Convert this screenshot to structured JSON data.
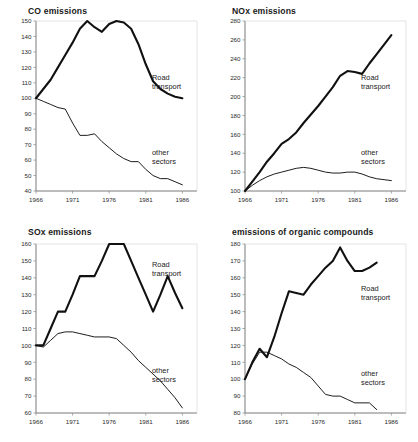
{
  "figure": {
    "background": "#ffffff",
    "ink_color": "#111111",
    "axis_color": "#6b6b6b"
  },
  "labels": {
    "road_transport": "Road\ntransport",
    "road_transport_line1": "Road",
    "road_transport_line2": "transport",
    "other_sectors_line1": "other",
    "other_sectors_line2": "sectors"
  },
  "chart_data": [
    {
      "id": "co",
      "type": "line",
      "title": "CO emissions",
      "xlabel": "",
      "ylabel": "",
      "xlim": [
        1966,
        1988
      ],
      "ylim": [
        40,
        150
      ],
      "ytick_step": 10,
      "yticks": [
        40,
        50,
        60,
        70,
        80,
        90,
        100,
        110,
        120,
        130,
        140,
        150
      ],
      "xticks": [
        1966,
        1971,
        1976,
        1981,
        1986
      ],
      "xticklabels": [
        "1966",
        "1971",
        "1976",
        "1981",
        "1986"
      ],
      "grid": false,
      "legend": "inline-annotations",
      "series": [
        {
          "name": "Road transport",
          "x": [
            1966,
            1967,
            1968,
            1969,
            1970,
            1971,
            1972,
            1973,
            1974,
            1975,
            1976,
            1977,
            1978,
            1979,
            1980,
            1981,
            1982,
            1983,
            1984,
            1985,
            1986
          ],
          "values": [
            100,
            106,
            112,
            120,
            128,
            136,
            145,
            150,
            146,
            143,
            148,
            150,
            149,
            145,
            135,
            122,
            111,
            106,
            103,
            101,
            100
          ]
        },
        {
          "name": "other sectors",
          "x": [
            1966,
            1967,
            1968,
            1969,
            1970,
            1971,
            1972,
            1973,
            1974,
            1975,
            1976,
            1977,
            1978,
            1979,
            1980,
            1981,
            1982,
            1983,
            1984,
            1985,
            1986
          ],
          "values": [
            100,
            98,
            96,
            94,
            93,
            84,
            76,
            76,
            77,
            72,
            68,
            64,
            61,
            59,
            59,
            54,
            50,
            48,
            48,
            46,
            44
          ]
        }
      ]
    },
    {
      "id": "nox",
      "type": "line",
      "title": "NOx emissions",
      "xlabel": "",
      "ylabel": "",
      "xlim": [
        1966,
        1988
      ],
      "ylim": [
        100,
        280
      ],
      "ytick_step": 20,
      "yticks": [
        100,
        120,
        140,
        160,
        180,
        200,
        220,
        240,
        260,
        280
      ],
      "xticks": [
        1966,
        1971,
        1976,
        1981,
        1986
      ],
      "xticklabels": [
        "1966",
        "1971",
        "1976",
        "1981",
        "1986"
      ],
      "grid": false,
      "legend": "inline-annotations",
      "series": [
        {
          "name": "Road transport",
          "x": [
            1966,
            1967,
            1968,
            1969,
            1970,
            1971,
            1972,
            1973,
            1974,
            1975,
            1976,
            1977,
            1978,
            1979,
            1980,
            1981,
            1982,
            1983,
            1984,
            1985,
            1986
          ],
          "values": [
            100,
            110,
            120,
            131,
            140,
            150,
            155,
            162,
            172,
            181,
            190,
            200,
            210,
            222,
            227,
            226,
            224,
            235,
            245,
            255,
            265
          ]
        },
        {
          "name": "other sectors",
          "x": [
            1966,
            1967,
            1968,
            1969,
            1970,
            1971,
            1972,
            1973,
            1974,
            1975,
            1976,
            1977,
            1978,
            1979,
            1980,
            1981,
            1982,
            1983,
            1984,
            1985,
            1986
          ],
          "values": [
            100,
            106,
            111,
            115,
            118,
            120,
            122,
            124,
            125,
            124,
            122,
            120,
            119,
            119,
            120,
            120,
            118,
            115,
            113,
            112,
            111
          ]
        }
      ]
    },
    {
      "id": "sox",
      "type": "line",
      "title": "SOx emissions",
      "xlabel": "",
      "ylabel": "",
      "xlim": [
        1966,
        1988
      ],
      "ylim": [
        60,
        160
      ],
      "ytick_step": 10,
      "yticks": [
        60,
        70,
        80,
        90,
        100,
        110,
        120,
        130,
        140,
        150,
        160
      ],
      "xticks": [
        1966,
        1971,
        1976,
        1981,
        1986
      ],
      "xticklabels": [
        "1966",
        "1971",
        "1976",
        "1981",
        "1986"
      ],
      "grid": false,
      "legend": "inline-annotations",
      "series": [
        {
          "name": "Road transport",
          "x": [
            1966,
            1967,
            1968,
            1969,
            1970,
            1971,
            1972,
            1973,
            1974,
            1975,
            1976,
            1977,
            1978,
            1979,
            1980,
            1981,
            1982,
            1983,
            1984,
            1985,
            1986
          ],
          "values": [
            100,
            100,
            110,
            120,
            120,
            130,
            141,
            141,
            141,
            150,
            160,
            160,
            160,
            150,
            140,
            130,
            120,
            130,
            141,
            131,
            122
          ]
        },
        {
          "name": "other sectors",
          "x": [
            1966,
            1967,
            1968,
            1969,
            1970,
            1971,
            1972,
            1973,
            1974,
            1975,
            1976,
            1977,
            1978,
            1979,
            1980,
            1981,
            1982,
            1983,
            1984,
            1985,
            1986
          ],
          "values": [
            100,
            99,
            103,
            107,
            108,
            108,
            107,
            106,
            105,
            105,
            105,
            104,
            100,
            96,
            91,
            87,
            83,
            79,
            74,
            69,
            63
          ]
        }
      ]
    },
    {
      "id": "organic",
      "type": "line",
      "title": "emissions of organic compounds",
      "xlabel": "",
      "ylabel": "",
      "xlim": [
        1966,
        1988
      ],
      "ylim": [
        80,
        180
      ],
      "ytick_step": 10,
      "yticks": [
        80,
        90,
        100,
        110,
        120,
        130,
        140,
        150,
        160,
        170,
        180
      ],
      "xticks": [
        1966,
        1971,
        1976,
        1981,
        1986
      ],
      "xticklabels": [
        "1966",
        "1971",
        "1976",
        "1981",
        "1986"
      ],
      "grid": false,
      "legend": "inline-annotations",
      "series": [
        {
          "name": "Road transport",
          "x": [
            1966,
            1967,
            1968,
            1969,
            1970,
            1971,
            1972,
            1973,
            1974,
            1975,
            1976,
            1977,
            1978,
            1979,
            1980,
            1981,
            1982,
            1983,
            1984
          ],
          "values": [
            100,
            110,
            118,
            113,
            125,
            139,
            152,
            151,
            150,
            156,
            161,
            166,
            170,
            178,
            170,
            164,
            164,
            166,
            169
          ]
        },
        {
          "name": "other sectors",
          "x": [
            1966,
            1967,
            1968,
            1969,
            1970,
            1971,
            1972,
            1973,
            1974,
            1975,
            1976,
            1977,
            1978,
            1979,
            1980,
            1981,
            1982,
            1983,
            1984
          ],
          "values": [
            100,
            109,
            116,
            116,
            114,
            112,
            109,
            107,
            104,
            101,
            96,
            91,
            90,
            90,
            88,
            86,
            86,
            86,
            82
          ]
        }
      ]
    }
  ]
}
